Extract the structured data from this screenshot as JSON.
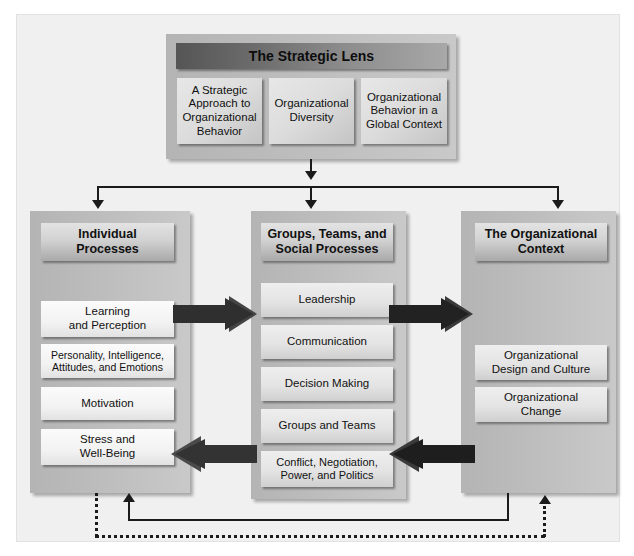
{
  "diagram": {
    "colors": {
      "canvas": "#f0f0f0",
      "panel": "#bdbdbd",
      "banner_dark": "#555555",
      "banner_light": "#a8a8a8",
      "line": "#1b1b1b",
      "arrow": "#2b2b2b",
      "text": "#111111"
    }
  },
  "strategic_lens": {
    "banner_label": "The Strategic Lens",
    "items": [
      {
        "label": "A Strategic\nApproach to\nOrganizational\nBehavior"
      },
      {
        "label": "Organizational\nDiversity"
      },
      {
        "label": "Organizational\nBehavior in a\nGlobal Context"
      }
    ]
  },
  "columns": [
    {
      "id": "individual-processes",
      "header": "Individual\nProcesses",
      "items": [
        {
          "label": "Learning\nand Perception"
        },
        {
          "label": "Personality, Intelligence,\nAttitudes, and Emotions"
        },
        {
          "label": "Motivation"
        },
        {
          "label": "Stress and\nWell-Being"
        }
      ]
    },
    {
      "id": "groups-teams-social-processes",
      "header": "Groups, Teams, and\nSocial Processes",
      "items": [
        {
          "label": "Leadership"
        },
        {
          "label": "Communication"
        },
        {
          "label": "Decision Making"
        },
        {
          "label": "Groups and Teams"
        },
        {
          "label": "Conflict, Negotiation,\nPower, and Politics"
        }
      ]
    },
    {
      "id": "the-organizational-context",
      "header": "The Organizational\nContext",
      "items": [
        {
          "label": "Organizational\nDesign and Culture"
        },
        {
          "label": "Organizational\nChange"
        }
      ]
    }
  ],
  "connectors": {
    "distributor_label": "strategic-lens-to-columns",
    "forward_arrows": [
      {
        "name": "individual-to-groups",
        "direction": "right"
      },
      {
        "name": "groups-to-context",
        "direction": "right"
      }
    ],
    "reverse_arrows": [
      {
        "name": "groups-to-individual",
        "direction": "left"
      },
      {
        "name": "context-to-groups",
        "direction": "left"
      }
    ],
    "feedback_solid": {
      "name": "context-to-individual-feedback",
      "style": "solid"
    },
    "feedback_dotted": {
      "name": "individual-to-context-feedback",
      "style": "dotted"
    }
  }
}
